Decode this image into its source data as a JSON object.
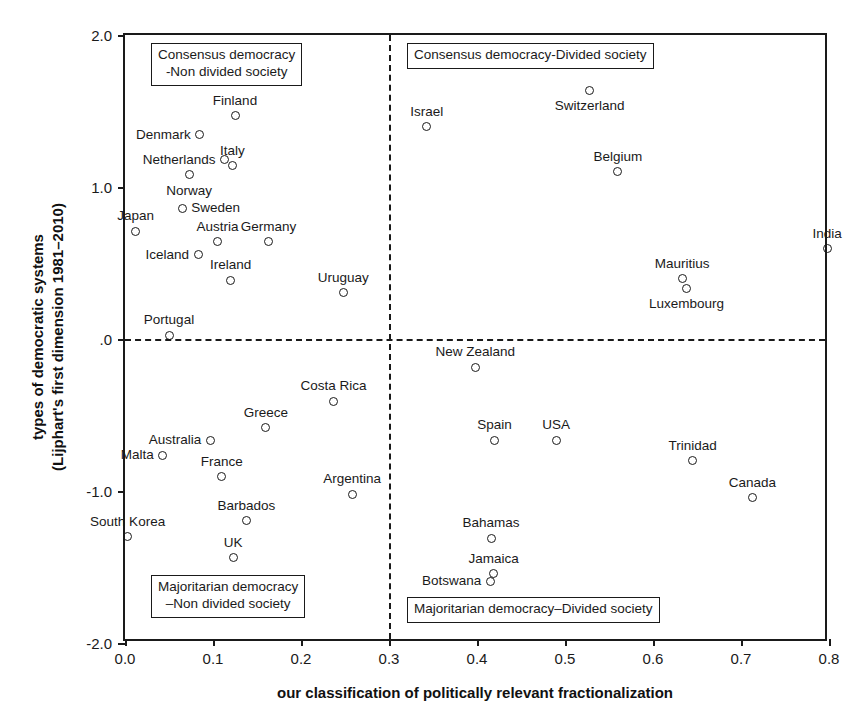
{
  "chart_data": {
    "type": "scatter",
    "title": "",
    "xlabel": "our classification of politically relevant fractionalization",
    "ylabel_line1": "types of democratic systems",
    "ylabel_line2": "(Lijphart's first dimension 1981–2010)",
    "xlim": [
      0.0,
      0.8
    ],
    "ylim": [
      -2.0,
      2.0
    ],
    "xticks": [
      "0.0",
      "0.1",
      "0.2",
      "0.3",
      "0.4",
      "0.5",
      "0.6",
      "0.7",
      "0.8"
    ],
    "xtick_values": [
      0.0,
      0.1,
      0.2,
      0.3,
      0.4,
      0.5,
      0.6,
      0.7,
      0.8
    ],
    "yticks": [
      "2.0",
      "1.0",
      ".0",
      "-1.0",
      "-2.0"
    ],
    "ytick_values": [
      2.0,
      1.0,
      0.0,
      -1.0,
      -2.0
    ],
    "grid": false,
    "legend": "none",
    "reference_lines": [
      {
        "name": "horizontal-zero-line",
        "axis": "y",
        "value": 0.0,
        "style": "dashed"
      },
      {
        "name": "vertical-threshold-line",
        "axis": "x",
        "value": 0.3,
        "style": "dashed"
      }
    ],
    "annotations": [
      {
        "name": "consensus-nondivided-box",
        "text_lines": [
          "Consensus democracy",
          "-Non divided society"
        ],
        "quadrant": "top-left"
      },
      {
        "name": "consensus-divided-box",
        "text_lines": [
          "Consensus democracy-Divided society"
        ],
        "quadrant": "top-right"
      },
      {
        "name": "majoritarian-nondivided-box",
        "text_lines": [
          "Majoritarian democracy",
          "–Non divided society"
        ],
        "quadrant": "bottom-left"
      },
      {
        "name": "majoritarian-divided-box",
        "text_lines": [
          "Majoritarian democracy–Divided society"
        ],
        "quadrant": "bottom-right"
      }
    ],
    "points": [
      {
        "label": "Finland",
        "x": 0.125,
        "y": 1.47,
        "anchor": "above"
      },
      {
        "label": "Denmark",
        "x": 0.085,
        "y": 1.345,
        "anchor": "left"
      },
      {
        "label": "Netherlands",
        "x": 0.113,
        "y": 1.18,
        "anchor": "left"
      },
      {
        "label": "Italy",
        "x": 0.122,
        "y": 1.14,
        "anchor": "above"
      },
      {
        "label": "Norway",
        "x": 0.073,
        "y": 1.08,
        "anchor": "below"
      },
      {
        "label": "Sweden",
        "x": 0.065,
        "y": 0.86,
        "anchor": "right"
      },
      {
        "label": "Japan",
        "x": 0.012,
        "y": 0.71,
        "anchor": "above"
      },
      {
        "label": "Austria",
        "x": 0.105,
        "y": 0.64,
        "anchor": "above"
      },
      {
        "label": "Germany",
        "x": 0.163,
        "y": 0.64,
        "anchor": "above"
      },
      {
        "label": "Iceland",
        "x": 0.083,
        "y": 0.555,
        "anchor": "left"
      },
      {
        "label": "Ireland",
        "x": 0.12,
        "y": 0.385,
        "anchor": "above"
      },
      {
        "label": "Uruguay",
        "x": 0.248,
        "y": 0.305,
        "anchor": "above"
      },
      {
        "label": "Portugal",
        "x": 0.05,
        "y": 0.025,
        "anchor": "above"
      },
      {
        "label": "Israel",
        "x": 0.343,
        "y": 1.395,
        "anchor": "above"
      },
      {
        "label": "Switzerland",
        "x": 0.528,
        "y": 1.635,
        "anchor": "below"
      },
      {
        "label": "Belgium",
        "x": 0.56,
        "y": 1.1,
        "anchor": "above"
      },
      {
        "label": "India",
        "x": 0.798,
        "y": 0.595,
        "anchor": "above"
      },
      {
        "label": "Mauritius",
        "x": 0.633,
        "y": 0.395,
        "anchor": "above"
      },
      {
        "label": "Luxembourg",
        "x": 0.638,
        "y": 0.335,
        "anchor": "below"
      },
      {
        "label": "New Zealand",
        "x": 0.398,
        "y": -0.185,
        "anchor": "above"
      },
      {
        "label": "Costa Rica",
        "x": 0.237,
        "y": -0.41,
        "anchor": "above"
      },
      {
        "label": "Greece",
        "x": 0.16,
        "y": -0.585,
        "anchor": "above"
      },
      {
        "label": "Australia",
        "x": 0.097,
        "y": -0.665,
        "anchor": "left"
      },
      {
        "label": "Malta",
        "x": 0.043,
        "y": -0.765,
        "anchor": "left"
      },
      {
        "label": "France",
        "x": 0.11,
        "y": -0.905,
        "anchor": "above"
      },
      {
        "label": "Argentina",
        "x": 0.258,
        "y": -1.02,
        "anchor": "above"
      },
      {
        "label": "Spain",
        "x": 0.42,
        "y": -0.665,
        "anchor": "above"
      },
      {
        "label": "USA",
        "x": 0.49,
        "y": -0.665,
        "anchor": "above"
      },
      {
        "label": "Trinidad",
        "x": 0.645,
        "y": -0.8,
        "anchor": "above"
      },
      {
        "label": "Canada",
        "x": 0.713,
        "y": -1.045,
        "anchor": "above"
      },
      {
        "label": "Barbados",
        "x": 0.138,
        "y": -1.195,
        "anchor": "above"
      },
      {
        "label": "South Korea",
        "x": 0.003,
        "y": -1.3,
        "anchor": "above"
      },
      {
        "label": "UK",
        "x": 0.123,
        "y": -1.44,
        "anchor": "above"
      },
      {
        "label": "Bahamas",
        "x": 0.416,
        "y": -1.31,
        "anchor": "above"
      },
      {
        "label": "Jamaica",
        "x": 0.419,
        "y": -1.545,
        "anchor": "above"
      },
      {
        "label": "Botswana",
        "x": 0.415,
        "y": -1.595,
        "anchor": "left"
      }
    ]
  }
}
